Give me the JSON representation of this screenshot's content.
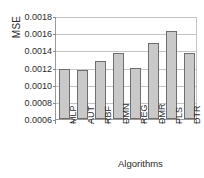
{
  "chart_data": {
    "type": "bar",
    "title": "",
    "xlabel": "Algorithms",
    "ylabel": "MSE",
    "categories": [
      "MLP",
      "AUT",
      "RBF",
      "DMN",
      "REG",
      "DMR",
      "PLS",
      "DTR"
    ],
    "values": [
      0.00118,
      0.00117,
      0.00128,
      0.00137,
      0.0012,
      0.00149,
      0.00163,
      0.00137
    ],
    "ylim": [
      0.0006,
      0.0018
    ],
    "ytick_values": [
      0.0018,
      0.0016,
      0.0014,
      0.0012,
      0.001,
      0.0008,
      0.0006
    ],
    "ytick_labels": [
      "0.0018",
      "0.0016",
      "0.0014",
      "0.0012",
      "0.0010",
      "0.0008",
      "0.0006"
    ],
    "grid": true,
    "legend": false,
    "bar_color": "#c9c9c9",
    "bar_edge_color": "#6e6e6e",
    "grid_color": "#c4c4c4",
    "axis_color": "#9a9a9a"
  }
}
